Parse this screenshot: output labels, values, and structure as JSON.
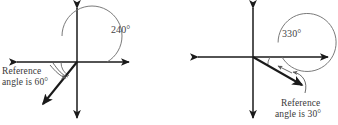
{
  "figure": {
    "background_color": "#ffffff",
    "stroke_color": "#1a1a1a",
    "arc_color": "#6b6b6b",
    "text_color": "#3a3a3a"
  },
  "diagrams": [
    {
      "id": "left",
      "angle_label": "240°",
      "reference_text_line1": "Reference",
      "reference_text_line2": "angle is 60°",
      "origin": {
        "x": 77,
        "y": 62
      },
      "angle_degrees": 240,
      "reference_angle_degrees": 60,
      "arc_radius": 30,
      "reference_arc_radius": 16,
      "axis": {
        "x_min": 15,
        "x_max": 131,
        "y_min": 6,
        "y_max": 120
      },
      "terminal_ray": {
        "x": 42,
        "y": 105
      }
    },
    {
      "id": "right",
      "angle_label": "330°",
      "reference_text_line1": "Reference",
      "reference_text_line2": "angle is 30°",
      "origin": {
        "x": 253,
        "y": 57
      },
      "angle_degrees": 330,
      "reference_angle_degrees": 30,
      "arc_radius": 29,
      "reference_arc_radius": 17,
      "axis": {
        "x_min": 196,
        "x_max": 330,
        "y_min": 6,
        "y_max": 120
      },
      "terminal_ray": {
        "x": 303,
        "y": 86
      }
    }
  ]
}
